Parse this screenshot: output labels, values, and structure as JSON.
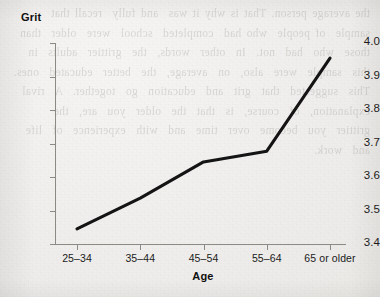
{
  "figure": {
    "background_color": "#f2f1ef",
    "ink_color": "#141414",
    "axis_color": "#8d8a85",
    "page_bleed_text": "the average person. That is why it was  and fully  recall that  sample  of people  who had  completed  school  were  older  than  those  who  had  not.  In  other  words,  the  grittier  adults  in  this  sample  were  also,  on  average,  the  better  educated  ones.  This  suggested  that  grit  and  education  go  together.  A  rival  explanation,  of  course,  is  that  the  older  you  are,  the  grittier  you  become  over  time  and  with  experience  of  life  and  work."
  },
  "chart_data": {
    "type": "line",
    "title": "",
    "xlabel": "Age",
    "ylabel": "Grit",
    "categories": [
      "25–34",
      "35–44",
      "45–54",
      "55–64",
      "65 or older"
    ],
    "values": [
      3.445,
      3.537,
      3.645,
      3.677,
      3.955
    ],
    "series": [
      {
        "name": "Grit",
        "values": [
          3.445,
          3.537,
          3.645,
          3.677,
          3.955
        ]
      }
    ],
    "ylim": [
      3.4,
      4.0
    ],
    "y_ticks": [
      "3.4",
      "3.5",
      "3.6",
      "3.7",
      "3.8",
      "3.9",
      "4.0"
    ],
    "y_tick_values": [
      3.4,
      3.5,
      3.6,
      3.7,
      3.8,
      3.9,
      4.0
    ],
    "grid": false,
    "legend": false,
    "legend_position": "none",
    "markers": false
  }
}
